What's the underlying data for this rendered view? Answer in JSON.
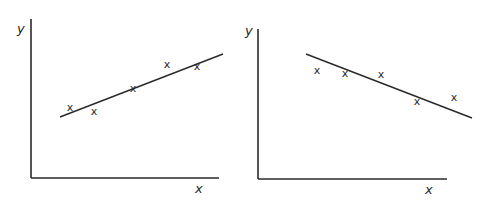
{
  "chart_data": [
    {
      "type": "scatter",
      "title": "Positive correlation",
      "xlabel": "x",
      "ylabel": "y",
      "marker": "x",
      "grid": false,
      "points": [
        [
          70,
          107
        ],
        [
          94,
          111
        ],
        [
          133,
          88
        ],
        [
          167,
          64
        ],
        [
          197,
          66
        ]
      ],
      "line_of_best_fit": {
        "from": [
          60,
          117
        ],
        "to": [
          223,
          54
        ]
      },
      "axes": {
        "origin": [
          31,
          178
        ],
        "x_end": 219,
        "y_top": 19
      }
    },
    {
      "type": "scatter",
      "title": "Negative correlation",
      "xlabel": "x",
      "ylabel": "y",
      "marker": "x",
      "grid": false,
      "points": [
        [
          317,
          70
        ],
        [
          345,
          73
        ],
        [
          381,
          74
        ],
        [
          417,
          101
        ],
        [
          454,
          97
        ]
      ],
      "line_of_best_fit": {
        "from": [
          306,
          54
        ],
        "to": [
          472,
          118
        ]
      },
      "axes": {
        "origin": [
          258,
          179
        ],
        "x_end": 447,
        "y_top": 29
      }
    }
  ],
  "labels": {
    "x": "x",
    "y": "y",
    "marker": "x"
  }
}
